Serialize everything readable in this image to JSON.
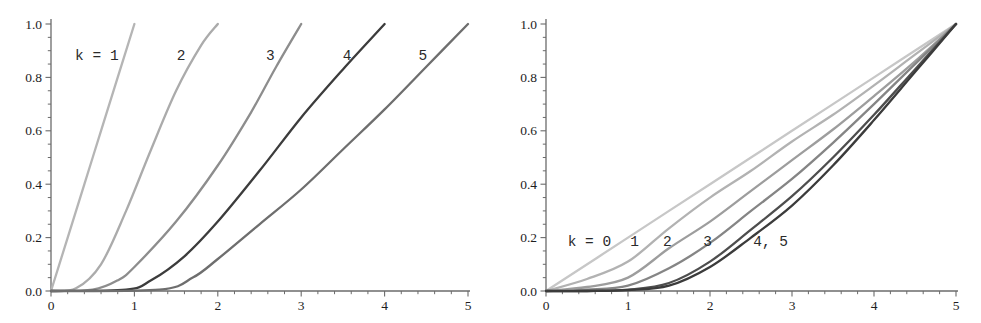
{
  "figure": {
    "background": "#ffffff",
    "description_left_labels": [
      "k = 1",
      "2",
      "3",
      "4",
      "5"
    ],
    "description_right_labels": [
      "k = 0",
      "1",
      "2",
      "3",
      "4, 5"
    ]
  },
  "chart_data": [
    {
      "type": "line",
      "panel": "left",
      "title": "",
      "xlabel": "",
      "ylabel": "",
      "xlim": [
        0,
        5
      ],
      "ylim": [
        0,
        1
      ],
      "grid": false,
      "legend": "inline-labels",
      "x_ticks": {
        "major": [
          0,
          1,
          2,
          3,
          4,
          5
        ],
        "labels": [
          "0",
          "1",
          "2",
          "3",
          "4",
          "5"
        ],
        "minor_step": 0.2
      },
      "y_ticks": {
        "major": [
          0,
          0.2,
          0.4,
          0.6,
          0.8,
          1.0
        ],
        "labels": [
          "0.0",
          "0.2",
          "0.4",
          "0.6",
          "0.8",
          "1.0"
        ],
        "minor_step": 0.05
      },
      "annotations": [
        {
          "text": "k = 1",
          "x": 0.55,
          "y": 0.885
        },
        {
          "text": "2",
          "x": 1.56,
          "y": 0.885
        },
        {
          "text": "3",
          "x": 2.63,
          "y": 0.885
        },
        {
          "text": "4",
          "x": 3.55,
          "y": 0.885
        },
        {
          "text": "5",
          "x": 4.46,
          "y": 0.885
        }
      ],
      "series": [
        {
          "name": "k=1",
          "color": "#b5b5b5",
          "x": [
            0,
            0.2,
            0.4,
            0.6,
            0.8,
            1.0
          ],
          "y": [
            0,
            0.2,
            0.4,
            0.6,
            0.8,
            1.0
          ]
        },
        {
          "name": "k=2",
          "color": "#ababab",
          "x": [
            0,
            0.3,
            0.6,
            0.9,
            1.2,
            1.5,
            1.8,
            2.0
          ],
          "y": [
            0,
            0.01,
            0.1,
            0.3,
            0.53,
            0.75,
            0.92,
            1.0
          ]
        },
        {
          "name": "k=3",
          "color": "#8d8d8d",
          "x": [
            0,
            0.5,
            0.8,
            1.0,
            1.5,
            2.0,
            2.4,
            2.7,
            3.0
          ],
          "y": [
            0,
            0.005,
            0.04,
            0.09,
            0.26,
            0.47,
            0.67,
            0.84,
            1.0
          ]
        },
        {
          "name": "k=4",
          "color": "#3c3c3c",
          "x": [
            0,
            0.9,
            1.2,
            1.6,
            2.0,
            2.5,
            3.0,
            3.5,
            4.0
          ],
          "y": [
            0,
            0.005,
            0.04,
            0.13,
            0.26,
            0.45,
            0.65,
            0.83,
            1.0
          ]
        },
        {
          "name": "k=5",
          "color": "#6e6e6e",
          "x": [
            0,
            1.3,
            1.7,
            2.0,
            2.5,
            3.0,
            3.5,
            4.0,
            4.5,
            5.0
          ],
          "y": [
            0,
            0.005,
            0.05,
            0.12,
            0.25,
            0.38,
            0.53,
            0.68,
            0.84,
            1.0
          ]
        }
      ]
    },
    {
      "type": "line",
      "panel": "right",
      "title": "",
      "xlabel": "",
      "ylabel": "",
      "xlim": [
        0,
        5
      ],
      "ylim": [
        0,
        1
      ],
      "grid": false,
      "legend": "inline-labels",
      "x_ticks": {
        "major": [
          0,
          1,
          2,
          3,
          4,
          5
        ],
        "labels": [
          "0",
          "1",
          "2",
          "3",
          "4",
          "5"
        ],
        "minor_step": 0.2
      },
      "y_ticks": {
        "major": [
          0,
          0.2,
          0.4,
          0.6,
          0.8,
          1.0
        ],
        "labels": [
          "0.0",
          "0.2",
          "0.4",
          "0.6",
          "0.8",
          "1.0"
        ],
        "minor_step": 0.05
      },
      "annotations": [
        {
          "text": "k = 0",
          "x": 0.53,
          "y": 0.187
        },
        {
          "text": "1",
          "x": 1.08,
          "y": 0.187
        },
        {
          "text": "2",
          "x": 1.48,
          "y": 0.187
        },
        {
          "text": "3",
          "x": 1.97,
          "y": 0.187
        },
        {
          "text": "4, 5",
          "x": 2.74,
          "y": 0.187
        }
      ],
      "series": [
        {
          "name": "k=0",
          "color": "#c7c7c7",
          "x": [
            0,
            1,
            2,
            3,
            4,
            5
          ],
          "y": [
            0,
            0.2,
            0.4,
            0.6,
            0.8,
            1.0
          ]
        },
        {
          "name": "k=1",
          "color": "#b2b2b2",
          "x": [
            0,
            0.5,
            1.0,
            1.5,
            2.0,
            2.5,
            3.0,
            3.5,
            4.0,
            4.5,
            5.0
          ],
          "y": [
            0,
            0.045,
            0.11,
            0.235,
            0.35,
            0.45,
            0.56,
            0.66,
            0.77,
            0.885,
            1.0
          ]
        },
        {
          "name": "k=2",
          "color": "#9d9d9d",
          "x": [
            0,
            0.5,
            1.0,
            1.5,
            2.0,
            2.5,
            3.0,
            3.5,
            4.0,
            4.5,
            5.0
          ],
          "y": [
            0,
            0.015,
            0.05,
            0.16,
            0.26,
            0.375,
            0.49,
            0.605,
            0.73,
            0.86,
            1.0
          ]
        },
        {
          "name": "k=3",
          "color": "#858585",
          "x": [
            0,
            0.5,
            1.0,
            1.5,
            2.0,
            2.5,
            3.0,
            3.5,
            4.0,
            4.5,
            5.0
          ],
          "y": [
            0,
            0.005,
            0.02,
            0.085,
            0.18,
            0.3,
            0.42,
            0.555,
            0.7,
            0.85,
            1.0
          ]
        },
        {
          "name": "k=4",
          "color": "#4e4e4e",
          "x": [
            0,
            0.5,
            1.0,
            1.5,
            2.0,
            2.5,
            3.0,
            3.5,
            4.0,
            4.5,
            5.0
          ],
          "y": [
            0,
            0.0,
            0.005,
            0.03,
            0.11,
            0.23,
            0.355,
            0.5,
            0.66,
            0.83,
            1.0
          ]
        },
        {
          "name": "k=5",
          "color": "#3b3b3b",
          "x": [
            0,
            0.5,
            1.0,
            1.5,
            2.0,
            2.5,
            3.0,
            3.5,
            4.0,
            4.5,
            5.0
          ],
          "y": [
            0,
            0.0,
            0.003,
            0.02,
            0.09,
            0.2,
            0.32,
            0.47,
            0.64,
            0.82,
            1.0
          ]
        }
      ]
    }
  ]
}
